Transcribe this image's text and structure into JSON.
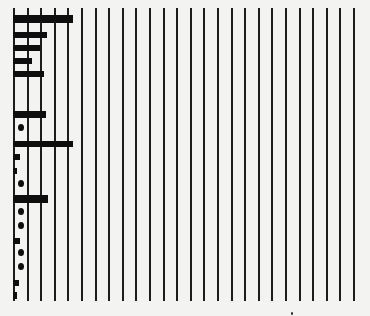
{
  "chart_data": {
    "type": "bar",
    "orientation": "horizontal",
    "title": "",
    "xlabel": "",
    "ylabel": "",
    "grid": {
      "vertical_lines": 26,
      "spacing_px": 13.6,
      "start_x": 14
    },
    "legend": null,
    "rows": [
      {
        "y": 15,
        "kind": "bar",
        "value_gridunits": 4.4,
        "height": 8
      },
      {
        "y": 32,
        "kind": "bar",
        "value_gridunits": 2.5,
        "height": 6
      },
      {
        "y": 45,
        "kind": "bar",
        "value_gridunits": 2.0,
        "height": 6
      },
      {
        "y": 58,
        "kind": "bar",
        "value_gridunits": 1.4,
        "height": 6
      },
      {
        "y": 71,
        "kind": "bar",
        "value_gridunits": 2.3,
        "height": 6
      },
      {
        "y": 111,
        "kind": "bar",
        "value_gridunits": 2.4,
        "height": 7
      },
      {
        "y": 124,
        "kind": "dot"
      },
      {
        "y": 141,
        "kind": "bar",
        "value_gridunits": 4.4,
        "height": 6
      },
      {
        "y": 154,
        "kind": "square",
        "w": 7,
        "h": 6
      },
      {
        "y": 168,
        "kind": "square",
        "w": 4,
        "h": 6
      },
      {
        "y": 180,
        "kind": "dot"
      },
      {
        "y": 195,
        "kind": "bar",
        "value_gridunits": 2.6,
        "height": 8
      },
      {
        "y": 208,
        "kind": "dot"
      },
      {
        "y": 222,
        "kind": "dot"
      },
      {
        "y": 238,
        "kind": "square",
        "w": 7,
        "h": 6
      },
      {
        "y": 249,
        "kind": "dot"
      },
      {
        "y": 263,
        "kind": "dot"
      },
      {
        "y": 280,
        "kind": "square",
        "w": 6,
        "h": 6
      },
      {
        "y": 292,
        "kind": "square",
        "w": 4,
        "h": 7
      }
    ]
  },
  "colors": {
    "background": "#f3f3f1",
    "ink": "#0e0e0e",
    "gridline": "#1d1d1d"
  }
}
